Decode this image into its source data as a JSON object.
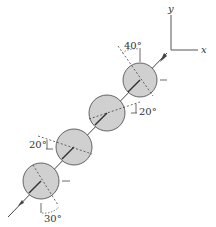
{
  "diagram": {
    "axes": {
      "x_label": "x",
      "y_label": "y"
    },
    "angles": [
      {
        "id": "top",
        "label": "40°"
      },
      {
        "id": "second",
        "label": "20°"
      },
      {
        "id": "third",
        "label": "20°"
      },
      {
        "id": "bottom",
        "label": "30°"
      }
    ],
    "colors": {
      "sphere_fill": "#d0d0d0",
      "stroke": "#444444",
      "background": "#ffffff"
    }
  }
}
